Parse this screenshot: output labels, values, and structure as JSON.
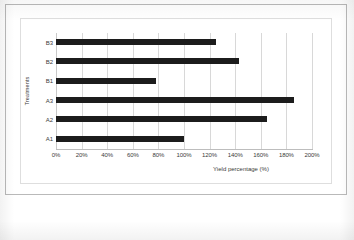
{
  "chart_data": {
    "type": "bar",
    "orientation": "horizontal",
    "title": "",
    "xlabel": "Yield percentage (%)",
    "ylabel": "Treatments",
    "categories": [
      "A1",
      "A2",
      "A3",
      "B1",
      "B2",
      "B3"
    ],
    "values": [
      100,
      165,
      186,
      78,
      143,
      125
    ],
    "series": [
      {
        "name": "Yield percentage",
        "values": [
          100,
          165,
          186,
          78,
          143,
          125
        ]
      }
    ],
    "xlim": [
      0,
      200
    ],
    "xticks": [
      0,
      20,
      40,
      60,
      80,
      100,
      120,
      140,
      160,
      180,
      200
    ],
    "xtick_labels": [
      "0%",
      "20%",
      "40%",
      "60%",
      "80%",
      "100%",
      "120%",
      "140%",
      "160%",
      "180%",
      "200%"
    ],
    "ytick_labels_top_to_bottom": [
      "B3",
      "B2",
      "B1",
      "A3",
      "A2",
      "A1"
    ],
    "grid": "vertical",
    "legend": "none",
    "bar_color": "#1c1c1c",
    "gridline_color": "#d8d8d8",
    "background_color": "#ffffff"
  }
}
